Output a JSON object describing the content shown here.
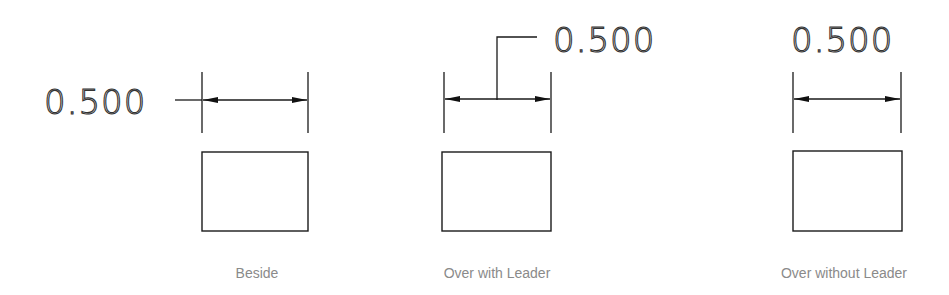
{
  "diagram": {
    "colors": {
      "line": "#1a1a1a",
      "caption": "#8a8a8a",
      "background": "#ffffff"
    },
    "panels": [
      {
        "id": "beside",
        "dimension_text": "0.500",
        "caption": "Beside"
      },
      {
        "id": "over-with-leader",
        "dimension_text": "0.500",
        "caption": "Over with Leader"
      },
      {
        "id": "over-without-leader",
        "dimension_text": "0.500",
        "caption": "Over without Leader"
      }
    ]
  }
}
